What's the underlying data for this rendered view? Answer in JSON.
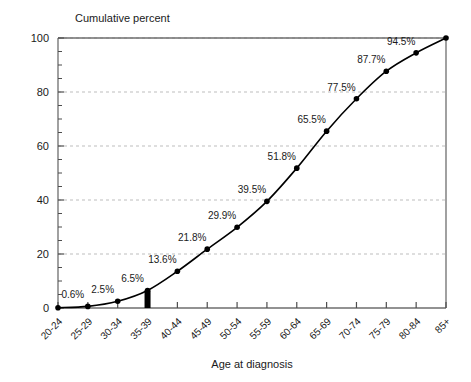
{
  "chart_data": {
    "type": "line",
    "title": "Cumulative percent",
    "xlabel": "Age at diagnosis",
    "ylabel": "Cumulative percent",
    "ylim": [
      0,
      100
    ],
    "yticks": [
      0,
      20,
      40,
      60,
      80,
      100
    ],
    "ytick_labels": [
      "0",
      "20",
      "40",
      "60",
      "80",
      "100"
    ],
    "y_minor_tick_step": 5,
    "grid": "horizontal-dashed",
    "legend": "none",
    "categories": [
      "20-24",
      "25-29",
      "30-34",
      "35-39",
      "40-44",
      "45-49",
      "50-54",
      "55-59",
      "60-64",
      "65-69",
      "70-74",
      "75-79",
      "80-84",
      "85+"
    ],
    "values": [
      0.1,
      0.6,
      2.5,
      6.5,
      13.6,
      21.8,
      29.9,
      39.5,
      51.8,
      65.5,
      77.5,
      87.7,
      94.5,
      100.0
    ],
    "point_labels": [
      "",
      "0.6%",
      "2.5%",
      "6.5%",
      "13.6%",
      "21.8%",
      "29.9%",
      "39.5%",
      "51.8%",
      "65.5%",
      "77.5%",
      "87.7%",
      "94.5%",
      ""
    ],
    "annotations": [
      {
        "name": "median-marker-bar",
        "category": "35-39",
        "description": "thick black vertical bar at 35-39 rising from baseline to curve"
      }
    ],
    "colors": {
      "curve": "#000000",
      "marker": "#000000",
      "grid": "#bdbdbd",
      "axis": "#6e6e6e",
      "text": "#1a1a1a",
      "background": "#ffffff"
    }
  }
}
